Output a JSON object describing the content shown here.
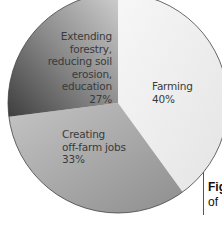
{
  "chart_data": {
    "type": "pie",
    "title": "",
    "categories": [
      "Farming",
      "Creating off-farm jobs",
      "Extending forestry, reducing soil erosion, education"
    ],
    "values": [
      40,
      33,
      27
    ],
    "unit": "%",
    "slices": [
      {
        "label": "Farming",
        "value": 40,
        "value_label": "40%",
        "color": "#ececec"
      },
      {
        "label": "Creating off-farm jobs",
        "value": 33,
        "value_label": "33%",
        "color": "#a9a9a9"
      },
      {
        "label": "Extending forestry, reducing soil erosion, education",
        "value": 27,
        "value_label": "27%",
        "color": "#6e6e6e"
      }
    ],
    "start_angle_deg": -90,
    "direction": "clockwise",
    "legend": "none (labels inside slices)"
  },
  "labels": {
    "farming": {
      "line1": "Farming",
      "pct": "40%"
    },
    "offfarm": {
      "line1": "Creating",
      "line2": "off-farm jobs",
      "pct": "33%"
    },
    "forestry": {
      "line1": "Extending",
      "line2": "forestry,",
      "line3": "reducing soil",
      "line4": "erosion, education",
      "pct": "27%"
    }
  },
  "caption": {
    "line1": "Fig",
    "line2": "of"
  }
}
